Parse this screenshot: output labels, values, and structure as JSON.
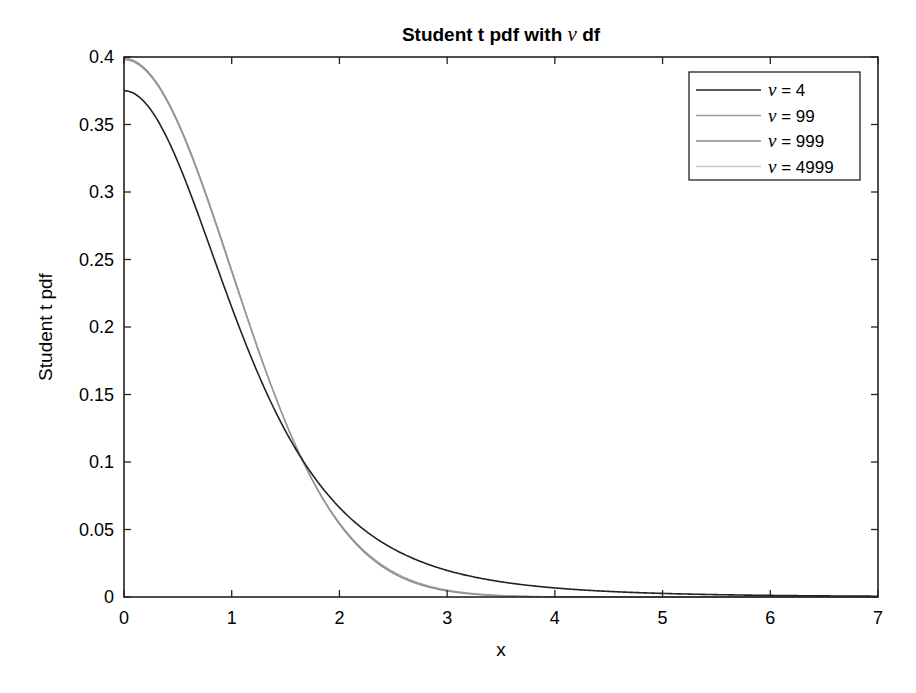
{
  "chart_data": {
    "type": "line",
    "title": "Student t pdf with ν df",
    "title_parts": {
      "prefix": "Student t pdf with ",
      "symbol": "ν",
      "suffix": " df"
    },
    "xlabel": "x",
    "ylabel": "Student t pdf",
    "xlim": [
      0,
      7
    ],
    "ylim": [
      0,
      0.4
    ],
    "xticks": [
      0,
      1,
      2,
      3,
      4,
      5,
      6,
      7
    ],
    "xtick_labels": [
      "0",
      "1",
      "2",
      "3",
      "4",
      "5",
      "6",
      "7"
    ],
    "yticks": [
      0,
      0.05,
      0.1,
      0.15,
      0.2,
      0.25,
      0.3,
      0.35,
      0.4
    ],
    "ytick_labels": [
      "0",
      "0.05",
      "0.1",
      "0.15",
      "0.2",
      "0.25",
      "0.3",
      "0.35",
      "0.4"
    ],
    "grid": false,
    "legend_position": "northeast",
    "x": [
      0,
      0.5,
      1,
      1.5,
      2,
      2.5,
      3,
      3.5,
      4,
      4.5,
      5,
      5.5,
      6,
      6.5,
      7
    ],
    "series": [
      {
        "name": "ν = 4",
        "nu": 4,
        "color": "#222222",
        "values": [
          0.375,
          0.32,
          0.2147,
          0.1252,
          0.0663,
          0.0338,
          0.0197,
          0.0108,
          0.0066,
          0.0042,
          0.0042,
          0.002,
          0.0014,
          0.001,
          0.0007
        ]
      },
      {
        "name": "ν = 99",
        "nu": 99,
        "color": "#9a9a9a",
        "values": [
          0.3979,
          0.3514,
          0.2411,
          0.129,
          0.0547,
          0.0189,
          0.0055,
          0.0014,
          0.0003,
          0.0001,
          0.0,
          0.0,
          0.0,
          0.0,
          0.0
        ]
      },
      {
        "name": "ν = 999",
        "nu": 999,
        "color": "#888888",
        "values": [
          0.3988,
          0.352,
          0.242,
          0.1295,
          0.054,
          0.0175,
          0.0044,
          0.0009,
          0.0001,
          0.0,
          0.0,
          0.0,
          0.0,
          0.0,
          0.0
        ]
      },
      {
        "name": "ν = 4999",
        "nu": 4999,
        "color": "#c8c8c8",
        "values": [
          0.3989,
          0.3521,
          0.242,
          0.1295,
          0.054,
          0.0175,
          0.0044,
          0.0009,
          0.0001,
          0.0,
          0.0,
          0.0,
          0.0,
          0.0,
          0.0
        ]
      }
    ]
  },
  "legend": {
    "items": [
      {
        "label": "ν = 4",
        "color": "#222222",
        "width": 1.6
      },
      {
        "label": "ν = 99",
        "color": "#9a9a9a",
        "width": 1.3
      },
      {
        "label": "ν = 999",
        "color": "#888888",
        "width": 1.3
      },
      {
        "label": "ν = 4999",
        "color": "#c8c8c8",
        "width": 1.3
      }
    ]
  }
}
